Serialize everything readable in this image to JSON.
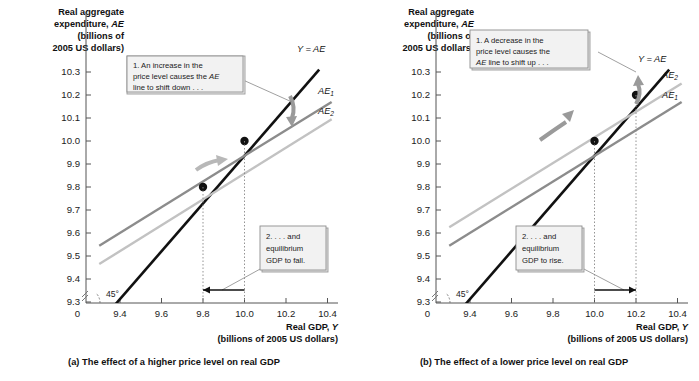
{
  "figure": {
    "panels": [
      {
        "id": "panel-a",
        "caption": "(a) The effect of a higher price level on real GDP",
        "callout1": {
          "line1": "1. An increase in the",
          "line2_pre": "price level causes the ",
          "line2_em": "AE",
          "line3": "line to shift down . . ."
        },
        "callout2": {
          "line1": "2. . . . and",
          "line2": "equilibrium",
          "line3": "GDP to fall."
        },
        "series_labels": {
          "identity": "Y = AE",
          "ae_upper_base": "AE",
          "ae_upper_sub": "1",
          "ae_lower_base": "AE",
          "ae_lower_sub": "2"
        },
        "angle_label": "45°"
      },
      {
        "id": "panel-b",
        "caption": "(b) The effect of a lower price level on real GDP",
        "callout1": {
          "line1": "1. A decrease in the",
          "line2_pre": "price level causes the",
          "line3_em": "AE",
          "line3_post": " line to shift up . . ."
        },
        "callout2": {
          "line1": "2. . . . and",
          "line2": "equilibrium",
          "line3": "GDP to rise."
        },
        "series_labels": {
          "identity": "Y = AE",
          "ae_upper_base": "AE",
          "ae_upper_sub": "2",
          "ae_lower_base": "AE",
          "ae_lower_sub": "1"
        },
        "angle_label": "45°"
      }
    ],
    "axis": {
      "y_title_line1": "Real aggregate",
      "y_title_line2_pre": "expenditure, ",
      "y_title_line2_em": "AE",
      "y_title_line3": "(billions of",
      "y_title_line4": "2005 US dollars)",
      "x_title_pre": "Real GDP, ",
      "x_title_em": "Y",
      "x_title_line2": "(billions of 2005 US dollars)",
      "origin_label": "0"
    }
  },
  "chart_data": [
    {
      "type": "line",
      "title": "(a) The effect of a higher price level on real GDP",
      "xlabel": "Real GDP, Y (billions of 2005 US dollars)",
      "ylabel": "Real aggregate expenditure, AE (billions of 2005 US dollars)",
      "xlim": [
        9.3,
        10.45
      ],
      "ylim": [
        9.22,
        10.38
      ],
      "xticks": [
        "9.4",
        "9.6",
        "9.8",
        "10.0",
        "10.2",
        "10.4"
      ],
      "xtick_values": [
        9.4,
        9.6,
        9.8,
        10.0,
        10.2,
        10.4
      ],
      "yticks": [
        "9.3",
        "9.4",
        "9.5",
        "9.6",
        "9.7",
        "9.8",
        "9.9",
        "10.0",
        "10.1",
        "10.2",
        "10.3"
      ],
      "ytick_values": [
        9.3,
        9.4,
        9.5,
        9.6,
        9.7,
        9.8,
        9.9,
        10.0,
        10.1,
        10.2,
        10.3
      ],
      "grid": false,
      "legend": "inline-right",
      "series": [
        {
          "name": "Y = AE",
          "color": "#111111",
          "width": 2.6,
          "points": [
            [
              9.33,
              9.24
            ],
            [
              10.36,
              10.31
            ]
          ]
        },
        {
          "name": "AE1",
          "color": "#8c8c8c",
          "width": 2.4,
          "points": [
            [
              9.3,
              9.545
            ],
            [
              10.42,
              10.17
            ]
          ]
        },
        {
          "name": "AE2",
          "color": "#c2c2c2",
          "width": 2.4,
          "points": [
            [
              9.3,
              9.465
            ],
            [
              10.42,
              10.095
            ]
          ]
        }
      ],
      "equilibria": [
        {
          "label": "initial",
          "x": 10.0,
          "y": 10.0
        },
        {
          "label": "new",
          "x": 9.8,
          "y": 9.8
        }
      ],
      "shift_direction": "down",
      "gdp_arrow": {
        "from": 10.0,
        "to": 9.8,
        "direction": "left"
      },
      "annotations": [
        "1. An increase in the price level causes the AE line to shift down . . .",
        "2. . . . and equilibrium GDP to fall."
      ]
    },
    {
      "type": "line",
      "title": "(b) The effect of a lower price level on real GDP",
      "xlabel": "Real GDP, Y (billions of 2005 US dollars)",
      "ylabel": "Real aggregate expenditure, AE (billions of 2005 US dollars)",
      "xlim": [
        9.3,
        10.45
      ],
      "ylim": [
        9.22,
        10.38
      ],
      "xticks": [
        "9.4",
        "9.6",
        "9.8",
        "10.0",
        "10.2",
        "10.4"
      ],
      "xtick_values": [
        9.4,
        9.6,
        9.8,
        10.0,
        10.2,
        10.4
      ],
      "yticks": [
        "9.3",
        "9.4",
        "9.5",
        "9.6",
        "9.7",
        "9.8",
        "9.9",
        "10.0",
        "10.1",
        "10.2",
        "10.3"
      ],
      "ytick_values": [
        9.3,
        9.4,
        9.5,
        9.6,
        9.7,
        9.8,
        9.9,
        10.0,
        10.1,
        10.2,
        10.3
      ],
      "grid": false,
      "legend": "inline-right",
      "series": [
        {
          "name": "Y = AE",
          "color": "#111111",
          "width": 2.6,
          "points": [
            [
              9.33,
              9.24
            ],
            [
              10.36,
              10.31
            ]
          ]
        },
        {
          "name": "AE2",
          "color": "#c2c2c2",
          "width": 2.4,
          "points": [
            [
              9.3,
              9.625
            ],
            [
              10.42,
              10.25
            ]
          ]
        },
        {
          "name": "AE1",
          "color": "#8c8c8c",
          "width": 2.4,
          "points": [
            [
              9.3,
              9.545
            ],
            [
              10.42,
              10.17
            ]
          ]
        }
      ],
      "equilibria": [
        {
          "label": "initial",
          "x": 10.0,
          "y": 10.0
        },
        {
          "label": "new",
          "x": 10.2,
          "y": 10.2
        }
      ],
      "shift_direction": "up",
      "gdp_arrow": {
        "from": 10.0,
        "to": 10.2,
        "direction": "right"
      },
      "annotations": [
        "1. A decrease in the price level causes the AE line to shift up . . .",
        "2. . . . and equilibrium GDP to rise."
      ]
    }
  ]
}
